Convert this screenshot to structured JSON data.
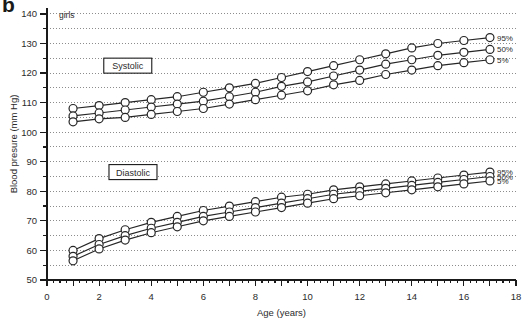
{
  "figure": {
    "panel_letter": "b",
    "group_label": "girls"
  },
  "axes": {
    "x": {
      "title": "Age (years)",
      "ticks": [
        0,
        2,
        4,
        6,
        8,
        10,
        12,
        14,
        16,
        18
      ],
      "min": 0,
      "max": 18,
      "major_step": 1,
      "minor_step": 0.25
    },
    "y": {
      "title": "Blood presure (mm Hg)",
      "ticks": [
        50,
        60,
        70,
        80,
        90,
        100,
        110,
        120,
        130,
        140
      ],
      "min": 50,
      "max": 142,
      "gridline_step": 5
    }
  },
  "annotations": {
    "systolic_box": "Systolic",
    "diastolic_box": "Diastolic"
  },
  "colors": {
    "line": "#262626",
    "marker_fill": "#ffffff",
    "grid": "#8c8c8c",
    "axis": "#1a1a1a",
    "text": "#2b2b2b"
  },
  "chart_data": {
    "type": "line",
    "title": "",
    "subtitle": "girls",
    "xlabel": "Age (years)",
    "ylabel": "Blood presure (mm Hg)",
    "xlim": [
      0,
      18
    ],
    "ylim": [
      50,
      142
    ],
    "grid": true,
    "legend_position": "right-inline",
    "x": [
      1,
      2,
      3,
      4,
      5,
      6,
      7,
      8,
      9,
      10,
      11,
      12,
      13,
      14,
      15,
      16,
      17
    ],
    "series": [
      {
        "name": "Systolic 95%",
        "label": "95%",
        "group": "Systolic",
        "percentile": 95,
        "values": [
          108,
          109,
          110,
          111,
          112,
          113.5,
          115,
          116.5,
          118.5,
          120.5,
          122.5,
          124.5,
          126.5,
          128.5,
          130,
          131,
          132
        ]
      },
      {
        "name": "Systolic 50%",
        "label": "50%",
        "group": "Systolic",
        "percentile": 50,
        "values": [
          105.5,
          106.5,
          107.5,
          108.5,
          109.5,
          110.5,
          112,
          113.5,
          115.5,
          117,
          119,
          121,
          123,
          124.5,
          126,
          127,
          128
        ]
      },
      {
        "name": "Systolic 5%",
        "label": "5%",
        "group": "Systolic",
        "percentile": 5,
        "values": [
          103.5,
          104.5,
          105,
          106,
          107,
          108,
          109.5,
          111,
          112.5,
          114,
          116,
          117.5,
          119.5,
          121,
          122.5,
          123.5,
          124.5
        ]
      },
      {
        "name": "Diastolic 95%",
        "label": "95%",
        "group": "Diastolic",
        "percentile": 95,
        "values": [
          60,
          64,
          67,
          69.5,
          71.5,
          73.5,
          75,
          76.5,
          78,
          79,
          80.5,
          81.5,
          82.5,
          83.5,
          84.5,
          85.5,
          86.5
        ]
      },
      {
        "name": "Diastolic 50%",
        "label": "50%",
        "group": "Diastolic",
        "percentile": 50,
        "values": [
          58,
          62,
          65,
          67.5,
          69.5,
          71.5,
          73,
          74.5,
          76,
          77.5,
          79,
          80,
          81,
          82,
          83,
          84,
          85
        ]
      },
      {
        "name": "Diastolic 5%",
        "label": "5%",
        "group": "Diastolic",
        "percentile": 5,
        "values": [
          56.5,
          60.5,
          63.5,
          66,
          68,
          70,
          71.5,
          73,
          74.5,
          76,
          77.5,
          78.5,
          79.5,
          80.5,
          81.5,
          82.5,
          83.5
        ]
      }
    ]
  }
}
